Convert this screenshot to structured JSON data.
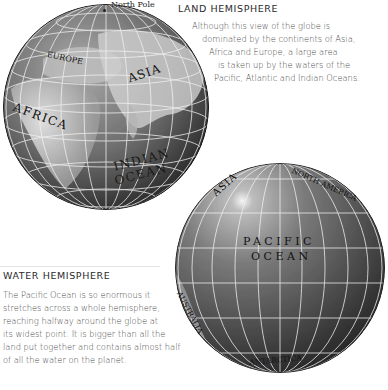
{
  "land_hemisphere": {
    "heading": "LAND HEMISPHERE",
    "text_lines": [
      "Although this view of the globe is",
      "dominated by the continents of Asia,",
      "Africa and Europe, a large area",
      "is taken up by the waters of the",
      "Pacific, Atlantic and Indian Oceans."
    ],
    "globe_labels": {
      "north_pole": "North Pole",
      "europe": "EUROPE",
      "asia": "ASIA",
      "africa": "AFRICA",
      "indian_ocean_1": "INDIAN",
      "indian_ocean_2": "OCEAN"
    }
  },
  "water_hemisphere": {
    "heading": "WATER HEMISPHERE",
    "text_lines": [
      "The Pacific Ocean is so enormous it",
      "stretches across a whole hemisphere,",
      "reaching halfway around the globe at",
      "its widest point. It is bigger than all the",
      "land put together and contains almost half",
      "of all the water on the planet."
    ],
    "globe_labels": {
      "asia": "ASIA",
      "north_america": "NORTH AMERICA",
      "pacific_ocean_1": "PACIFIC",
      "pacific_ocean_2": "OCEAN",
      "australia": "AUSTRALIA",
      "antarctica": "ANTARCTICA"
    }
  }
}
